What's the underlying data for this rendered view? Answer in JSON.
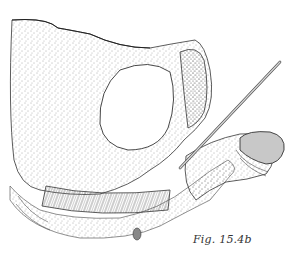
{
  "figure": {
    "caption": "Fig. 15.4b",
    "style": "stippled pen-and-ink anatomical illustration",
    "colors": {
      "background": "#ffffff",
      "ink": "#2a2a2a",
      "stipple": "#555555",
      "probe": "#9a9a9a",
      "glans_fill": "#c8c8c8"
    }
  }
}
